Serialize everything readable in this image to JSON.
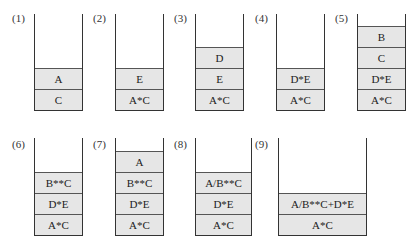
{
  "stacks": [
    {
      "label": "(1)",
      "cells": [
        "A",
        "C"
      ]
    },
    {
      "label": "(2)",
      "cells": [
        "E",
        "A*C"
      ]
    },
    {
      "label": "(3)",
      "cells": [
        "D",
        "E",
        "A*C"
      ]
    },
    {
      "label": "(4)",
      "cells": [
        "D*E",
        "A*C"
      ]
    },
    {
      "label": "(5)",
      "cells": [
        "B",
        "C",
        "D*E",
        "A*C"
      ]
    },
    {
      "label": "(6)",
      "cells": [
        "B**C",
        "D*E",
        "A*C"
      ]
    },
    {
      "label": "(7)",
      "cells": [
        "A",
        "B**C",
        "D*E",
        "A*C"
      ]
    },
    {
      "label": "(8)",
      "cells": [
        "A/B**C",
        "D*E",
        "A*C"
      ]
    },
    {
      "label": "(9)",
      "cells": [
        "A/B**C+D*E",
        "A*C"
      ]
    }
  ]
}
